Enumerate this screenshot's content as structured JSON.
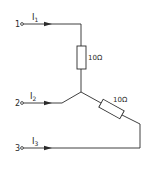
{
  "diagram": {
    "type": "star (Y) resistor network",
    "terminals": [
      {
        "id": "1",
        "label": "1",
        "current": "I",
        "current_sub": "1"
      },
      {
        "id": "2",
        "label": "2",
        "current": "I",
        "current_sub": "2"
      },
      {
        "id": "3",
        "label": "3",
        "current": "I",
        "current_sub": "3"
      }
    ],
    "resistors": [
      {
        "id": "R1",
        "value": "10Ω",
        "branch": "terminal-1 to junction"
      },
      {
        "id": "R2",
        "value": "10Ω",
        "branch": "junction to terminal-3"
      }
    ],
    "colors": {
      "line": "#2a2a2a",
      "background": "#ffffff"
    }
  }
}
